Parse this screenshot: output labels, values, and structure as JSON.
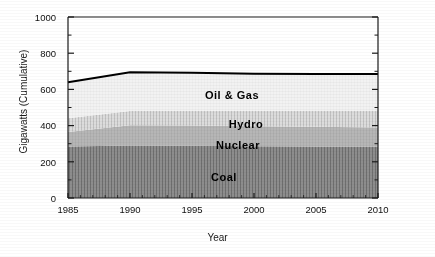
{
  "chart_data": {
    "type": "area",
    "title": "",
    "subtitle": "",
    "xlabel": "Year",
    "ylabel": "Gigawatts (Cumulative)",
    "xlim": [
      1985,
      2010
    ],
    "ylim": [
      0,
      1000
    ],
    "grid": false,
    "legend": "inline-band-labels",
    "stacked": true,
    "x": [
      1985,
      1990,
      1995,
      2000,
      2005,
      2010
    ],
    "y_ticks": [
      0,
      200,
      400,
      600,
      800,
      1000
    ],
    "y_minor_ticks": [
      100,
      300,
      500,
      700,
      900
    ],
    "x_ticks": [
      1985,
      1990,
      1995,
      2000,
      2005,
      2010
    ],
    "series": [
      {
        "name": "Coal",
        "values": [
          285,
          290,
          288,
          286,
          285,
          284
        ],
        "color": "#8f8f8f"
      },
      {
        "name": "Nuclear",
        "values": [
          80,
          112,
          112,
          110,
          108,
          106
        ],
        "color": "#b5b5b5"
      },
      {
        "name": "Hydro",
        "values": [
          75,
          78,
          82,
          86,
          88,
          90
        ],
        "color": "#d2d2d2"
      },
      {
        "name": "Oil & Gas",
        "values": [
          200,
          215,
          210,
          205,
          204,
          205
        ],
        "color": "#f0f0f0"
      }
    ],
    "cumulative_tops": {
      "Coal": [
        285,
        290,
        288,
        286,
        285,
        284
      ],
      "Nuclear": [
        365,
        402,
        400,
        396,
        393,
        390
      ],
      "Hydro": [
        440,
        480,
        482,
        482,
        481,
        480
      ],
      "Oil & Gas": [
        640,
        695,
        692,
        687,
        685,
        685
      ]
    },
    "total_line": {
      "name": "Total",
      "values": [
        640,
        695,
        692,
        687,
        685,
        685
      ],
      "color": "#000000"
    }
  },
  "axes": {
    "y": {
      "title": "Gigawatts (Cumulative)",
      "labels": [
        "1000",
        "800",
        "600",
        "400",
        "200",
        "0"
      ]
    },
    "x": {
      "title": "Year",
      "labels": [
        "1985",
        "1990",
        "1995",
        "2000",
        "2005",
        "2010"
      ]
    }
  },
  "band_labels": [
    {
      "text": "Oil  &  Gas",
      "name": "band-label-oil-gas"
    },
    {
      "text": "Hydro",
      "name": "band-label-hydro"
    },
    {
      "text": "Nuclear",
      "name": "band-label-nuclear"
    },
    {
      "text": "Coal",
      "name": "band-label-coal"
    }
  ],
  "colors": {
    "coal": "#8f8f8f",
    "nuclear": "#b5b5b5",
    "hydro": "#d2d2d2",
    "oil_gas": "#f0f0f0",
    "line": "#000000",
    "axis": "#1a1a1a",
    "background": "#ffffff"
  }
}
